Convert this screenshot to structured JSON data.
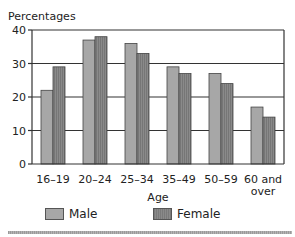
{
  "chart_data": {
    "type": "bar",
    "title": "",
    "ylabel": "Percentages",
    "xlabel": "Age",
    "ylim": [
      0,
      40
    ],
    "yticks": [
      0,
      10,
      20,
      30,
      40
    ],
    "grid": true,
    "categories": [
      [
        "16–19"
      ],
      [
        "20–24"
      ],
      [
        "25–34"
      ],
      [
        "35–49"
      ],
      [
        "50–59"
      ],
      [
        "60 and",
        "over"
      ]
    ],
    "series": [
      {
        "name": "Male",
        "color": "#a7a7a7",
        "values": [
          22,
          37,
          36,
          29,
          27,
          17
        ]
      },
      {
        "name": "Female",
        "color": "#858585",
        "values": [
          29,
          38,
          33,
          27,
          24,
          14
        ]
      }
    ],
    "legend_position": "bottom"
  },
  "legend": {
    "male_label": "Male",
    "female_label": "Female"
  }
}
